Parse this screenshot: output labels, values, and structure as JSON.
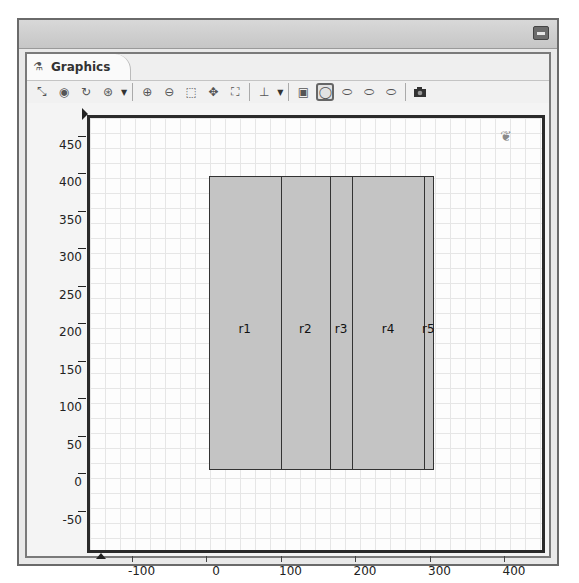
{
  "window": {
    "tab_label": "Graphics",
    "tab_icon": "graphics-tab-icon"
  },
  "toolbar": {
    "buttons": [
      {
        "name": "select-icon",
        "glyph": "⤡"
      },
      {
        "name": "eye-icon",
        "glyph": "◉"
      },
      {
        "name": "rotate-icon",
        "glyph": "↻"
      },
      {
        "name": "view-settings-icon",
        "glyph": "⊛"
      },
      {
        "name": "zoom-in-icon",
        "glyph": "⊕"
      },
      {
        "name": "zoom-out-icon",
        "glyph": "⊖"
      },
      {
        "name": "zoom-box-icon",
        "glyph": "⬚"
      },
      {
        "name": "pan-icon",
        "glyph": "✥"
      },
      {
        "name": "zoom-extents-icon",
        "glyph": "⛶"
      },
      {
        "name": "axis-icon",
        "glyph": "⊥"
      },
      {
        "name": "select-domain-icon",
        "glyph": "▣"
      },
      {
        "name": "select-boundary-icon",
        "glyph": "◯"
      },
      {
        "name": "select-edge-icon",
        "glyph": "⬭"
      },
      {
        "name": "select-point-icon",
        "glyph": "⬭"
      },
      {
        "name": "select-all-icon",
        "glyph": "⬭"
      },
      {
        "name": "screenshot-icon",
        "glyph": "📷"
      }
    ],
    "active_button": "select-boundary-icon"
  },
  "plot": {
    "y_ticks": [
      "450",
      "400",
      "350",
      "300",
      "250",
      "200",
      "150",
      "100",
      "50",
      "0",
      "-50"
    ],
    "y_values": [
      450,
      400,
      350,
      300,
      250,
      200,
      150,
      100,
      50,
      0,
      -50
    ],
    "x_ticks": [
      "-100",
      "0",
      "100",
      "200",
      "300",
      "400"
    ],
    "x_values": [
      -100,
      0,
      100,
      200,
      300,
      400
    ],
    "rectangles": [
      {
        "label": "r1",
        "x0": -10,
        "x1": 87,
        "y0": 15,
        "y1": 407
      },
      {
        "label": "r2",
        "x0": 87,
        "x1": 153,
        "y0": 15,
        "y1": 407
      },
      {
        "label": "r3",
        "x0": 153,
        "x1": 183,
        "y0": 15,
        "y1": 407
      },
      {
        "label": "r4",
        "x0": 183,
        "x1": 279,
        "y0": 15,
        "y1": 407
      },
      {
        "label": "r5",
        "x0": 279,
        "x1": 291,
        "y0": 15,
        "y1": 407
      }
    ],
    "fill_color": "#c4c4c4",
    "edge_color": "#333333",
    "grid_color": "#e6e6e6"
  }
}
